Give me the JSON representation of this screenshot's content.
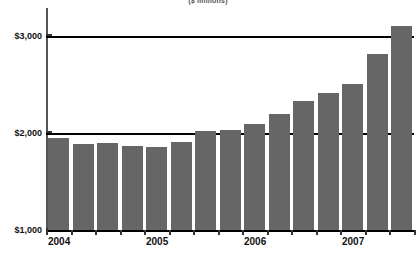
{
  "chart_data": {
    "type": "bar",
    "title": "($ millions)",
    "xlabel": "",
    "ylabel": "",
    "ylim": [
      1000,
      3200
    ],
    "grid": true,
    "legend": "none",
    "ytick_labels": [
      "$3,000",
      "$2,000",
      "$1,000"
    ],
    "ytick_values": [
      3000,
      2000,
      1000
    ],
    "xtick_labels": [
      "2004",
      "2005",
      "2006",
      "2007"
    ],
    "categories": [
      "2004 Q1",
      "2004 Q2",
      "2004 Q3",
      "2004 Q4",
      "2005 Q1",
      "2005 Q2",
      "2005 Q3",
      "2005 Q4",
      "2006 Q1",
      "2006 Q2",
      "2006 Q3",
      "2006 Q4",
      "2007 Q1",
      "2007 Q2",
      "2007 Q3"
    ],
    "values": [
      1950,
      1890,
      1895,
      1870,
      1860,
      1905,
      2020,
      2030,
      2095,
      2195,
      2335,
      2415,
      2510,
      2810,
      3105
    ],
    "bar_color": "#666666",
    "axis_color": "#333333",
    "gridline_color": "#000000"
  }
}
